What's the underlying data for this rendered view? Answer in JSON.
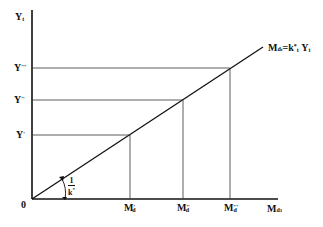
{
  "diagram": {
    "y_axis_label": "Y",
    "y_axis_sub": "t",
    "x_axis_label": "M",
    "x_axis_sub": "d",
    "x_axis_subsub": "1",
    "origin_label": "0",
    "line_label": {
      "lhs": "M",
      "lhs_sub": "d",
      "lhs_subsub": "t",
      "eq": "=",
      "k": "k",
      "k_sup": "*",
      "k_sub": "t",
      "y": "Y",
      "y_sub": "t"
    },
    "slope_label": {
      "numerator": "1",
      "denominator": "k",
      "den_sup": "*"
    },
    "y_levels": [
      {
        "base": "Y",
        "sup": "'"
      },
      {
        "base": "Y",
        "sup": "''"
      },
      {
        "base": "Y",
        "sup": "'''"
      }
    ],
    "x_levels": [
      {
        "base": "M",
        "sup": "'",
        "sub": "d"
      },
      {
        "base": "M",
        "sup": "''",
        "sub": "d"
      },
      {
        "base": "M",
        "sup": "'''",
        "sub": "d"
      }
    ]
  }
}
